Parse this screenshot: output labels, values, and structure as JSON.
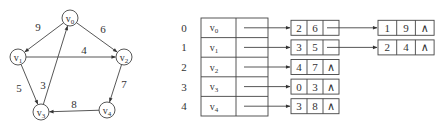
{
  "graph": {
    "nodes": [
      {
        "id": "v0",
        "base": "v",
        "sub": "0",
        "x": 70,
        "y": 18
      },
      {
        "id": "v1",
        "base": "v",
        "sub": "1",
        "x": 18,
        "y": 57
      },
      {
        "id": "v2",
        "base": "v",
        "sub": "2",
        "x": 124,
        "y": 57
      },
      {
        "id": "v3",
        "base": "v",
        "sub": "3",
        "x": 41,
        "y": 112
      },
      {
        "id": "v4",
        "base": "v",
        "sub": "4",
        "x": 107,
        "y": 110
      }
    ],
    "edges": [
      {
        "from": "v0",
        "to": "v1",
        "weight": "9",
        "lx": 38,
        "ly": 31
      },
      {
        "from": "v0",
        "to": "v2",
        "weight": "6",
        "lx": 103,
        "ly": 33
      },
      {
        "from": "v1",
        "to": "v2",
        "weight": "4",
        "lx": 84,
        "ly": 54
      },
      {
        "from": "v1",
        "to": "v3",
        "weight": "5",
        "lx": 19,
        "ly": 92
      },
      {
        "from": "v3",
        "to": "v0",
        "weight": "3",
        "lx": 43,
        "ly": 89
      },
      {
        "from": "v2",
        "to": "v4",
        "weight": "7",
        "lx": 124,
        "ly": 88
      },
      {
        "from": "v4",
        "to": "v3",
        "weight": "8",
        "lx": 74,
        "ly": 108
      }
    ]
  },
  "adjacency_list": {
    "rows": [
      {
        "index": "0",
        "vertex": "v",
        "sub": "0",
        "edges": [
          {
            "adjvex": "2",
            "weight": "6"
          },
          {
            "adjvex": "1",
            "weight": "9"
          }
        ]
      },
      {
        "index": "1",
        "vertex": "v",
        "sub": "1",
        "edges": [
          {
            "adjvex": "3",
            "weight": "5"
          },
          {
            "adjvex": "2",
            "weight": "4"
          }
        ]
      },
      {
        "index": "2",
        "vertex": "v",
        "sub": "2",
        "edges": [
          {
            "adjvex": "4",
            "weight": "7"
          }
        ]
      },
      {
        "index": "3",
        "vertex": "v",
        "sub": "3",
        "edges": [
          {
            "adjvex": "0",
            "weight": "3"
          }
        ]
      },
      {
        "index": "4",
        "vertex": "v",
        "sub": "4",
        "edges": [
          {
            "adjvex": "3",
            "weight": "8"
          }
        ]
      }
    ],
    "null_symbol": "∧"
  }
}
